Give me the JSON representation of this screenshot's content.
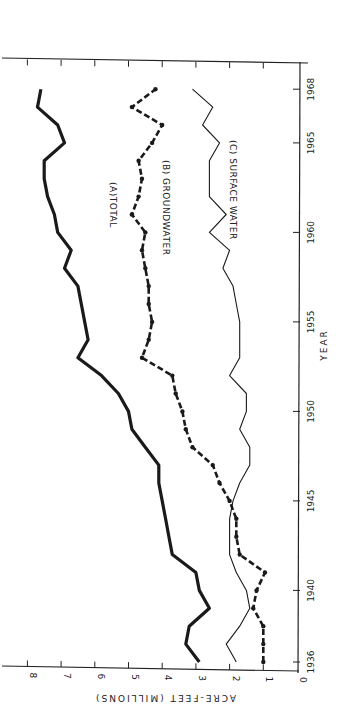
{
  "chart_data": {
    "type": "line",
    "title": "",
    "xlabel": "YEAR",
    "ylabel": "ACRE-FEET (MILLIONS)",
    "orientation": "rotated 90deg (year axis vertical on right, value axis horizontal at bottom, labels rotated)",
    "xlim": [
      1936,
      1968
    ],
    "ylim": [
      0,
      8
    ],
    "x_ticks": [
      1936,
      1940,
      1945,
      1950,
      1955,
      1960,
      1965,
      1968
    ],
    "y_ticks": [
      0,
      1,
      2,
      3,
      4,
      5,
      6,
      7,
      8
    ],
    "grid": false,
    "x": [
      1936,
      1937,
      1938,
      1939,
      1940,
      1941,
      1942,
      1943,
      1944,
      1945,
      1946,
      1947,
      1948,
      1949,
      1950,
      1951,
      1952,
      1953,
      1954,
      1955,
      1956,
      1957,
      1958,
      1959,
      1960,
      1961,
      1962,
      1963,
      1964,
      1965,
      1966,
      1967,
      1968
    ],
    "series": [
      {
        "name": "(A) TOTAL",
        "style": "thick solid",
        "values": [
          2.9,
          3.3,
          3.2,
          2.6,
          2.9,
          3.0,
          3.7,
          3.8,
          3.9,
          4.0,
          4.1,
          4.1,
          4.5,
          4.9,
          5.0,
          5.3,
          5.8,
          6.5,
          6.2,
          6.3,
          6.4,
          6.5,
          6.9,
          6.7,
          7.1,
          7.2,
          7.4,
          7.5,
          7.5,
          6.9,
          7.1,
          7.7,
          7.6
        ]
      },
      {
        "name": "(B) GROUNDWATER",
        "style": "dash-dot with dots",
        "values": [
          1.0,
          1.0,
          1.0,
          1.3,
          1.2,
          0.95,
          1.7,
          1.8,
          1.8,
          2.0,
          2.3,
          2.5,
          3.1,
          3.3,
          3.4,
          3.6,
          3.7,
          4.6,
          4.4,
          4.3,
          4.4,
          4.4,
          4.5,
          4.6,
          4.5,
          4.9,
          4.7,
          4.6,
          4.7,
          4.3,
          4.0,
          4.9,
          4.2
        ]
      },
      {
        "name": "(C) SURFACE WATER",
        "style": "thin solid",
        "values": [
          1.8,
          2.1,
          1.7,
          1.4,
          1.5,
          1.8,
          2.0,
          2.0,
          2.0,
          1.9,
          1.7,
          1.4,
          1.4,
          1.7,
          1.5,
          1.5,
          2.0,
          1.7,
          1.7,
          1.7,
          1.8,
          1.9,
          2.2,
          2.0,
          2.6,
          2.1,
          2.6,
          2.6,
          2.6,
          2.3,
          2.8,
          2.5,
          3.1
        ]
      }
    ]
  },
  "labels": {
    "xlabel": "YEAR",
    "ylabel": "ACRE-FEET (MILLIONS)",
    "series_a": "(A)TOTAL",
    "series_b": "(B) GROUNDWATER",
    "series_c": "(C) SURFACE WATER"
  }
}
